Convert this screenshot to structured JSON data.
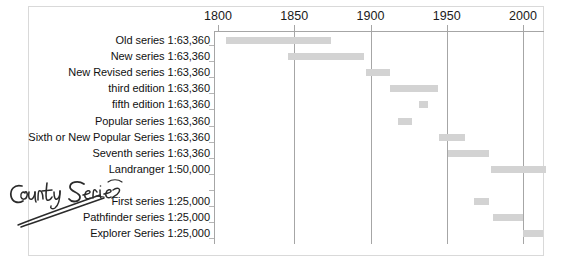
{
  "chart_data": {
    "type": "bar",
    "orientation": "horizontal",
    "subtype": "gantt-timeline",
    "title": "",
    "xlabel": "",
    "ylabel": "",
    "xlim": [
      1795,
      2020
    ],
    "xticks": [
      1800,
      1850,
      1900,
      1950,
      2000
    ],
    "xtick_labels": [
      "1800",
      "1850",
      "1900",
      "1950",
      "2000"
    ],
    "grid": true,
    "grid_axis": "x",
    "legend": false,
    "bar_color": "#d3d3d3",
    "axis_color": "#a6a6a6",
    "categories": [
      "Old series 1:63,360",
      "New series 1:63,360",
      "New Revised series 1:63,360",
      "third edition 1:63,360",
      "fifth edition 1:63,360",
      "Popular series 1:63,360",
      "Sixth or New Popular Series 1:63,360",
      "Seventh series 1:63,360",
      "Landranger 1:50,000",
      "",
      "First series 1:25,000",
      "Pathfinder series 1:25,000",
      "Explorer Series 1:25,000"
    ],
    "bars": [
      {
        "label": "Old series 1:63,360",
        "start": 1805,
        "end": 1874
      },
      {
        "label": "New series 1:63,360",
        "start": 1846,
        "end": 1896
      },
      {
        "label": "New Revised series 1:63,360",
        "start": 1897,
        "end": 1913
      },
      {
        "label": "third edition 1:63,360",
        "start": 1913,
        "end": 1944
      },
      {
        "label": "fifth edition 1:63,360",
        "start": 1932,
        "end": 1938
      },
      {
        "label": "Popular series 1:63,360",
        "start": 1918,
        "end": 1927
      },
      {
        "label": "Sixth or New Popular Series 1:63,360",
        "start": 1945,
        "end": 1962
      },
      {
        "label": "Seventh series 1:63,360",
        "start": 1951,
        "end": 1978
      },
      {
        "label": "Landranger 1:50,000",
        "start": 1979,
        "end": 2015
      },
      {
        "label": "",
        "start": null,
        "end": null
      },
      {
        "label": "First series 1:25,000",
        "start": 1968,
        "end": 1978
      },
      {
        "label": "Pathfinder series 1:25,000",
        "start": 1980,
        "end": 2000
      },
      {
        "label": "Explorer Series 1:25,000",
        "start": 2000,
        "end": 2013
      }
    ]
  },
  "annotation": {
    "handwritten_text": "County Series",
    "style": "handwritten-ink-with-double-underline-arrow"
  }
}
